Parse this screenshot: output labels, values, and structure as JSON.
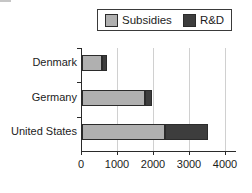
{
  "figure": {
    "background": "#ffffff"
  },
  "legend": {
    "border_color": "#3a3a3a"
  },
  "chart_data": {
    "type": "bar",
    "orientation": "horizontal",
    "stacked": true,
    "categories": [
      "Denmark",
      "Germany",
      "United States"
    ],
    "series": [
      {
        "name": "Subsidies",
        "color": "#b0b0b0",
        "values": [
          550,
          1750,
          2300
        ]
      },
      {
        "name": "R&D",
        "color": "#3d3d3d",
        "values": [
          150,
          200,
          1200
        ]
      }
    ],
    "xlim": [
      0,
      4000
    ],
    "xticks": [
      0,
      1000,
      2000,
      3000,
      4000
    ],
    "grid": "vertical-gridlines",
    "legend_position": "top",
    "axis_color": "#2a2a2a",
    "gridline_color": "#d0d0d0",
    "segment_border_color": "#2b2b2b"
  }
}
